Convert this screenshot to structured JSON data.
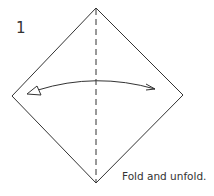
{
  "step": {
    "number": "1",
    "caption": "Fold and unfold."
  },
  "diagram": {
    "type": "origami-step",
    "shape": "square-diamond",
    "vertices": {
      "top": [
        96,
        8
      ],
      "right": [
        183,
        95
      ],
      "bottom": [
        96,
        183
      ],
      "left": [
        12,
        96
      ]
    },
    "fold_line": {
      "style": "dashed",
      "orientation": "vertical",
      "label": "valley-fold"
    },
    "arrow": {
      "type": "fold-and-unfold",
      "direction": "bidirectional-horizontal"
    },
    "colors": {
      "stroke": "#333333",
      "background": "#ffffff"
    }
  }
}
